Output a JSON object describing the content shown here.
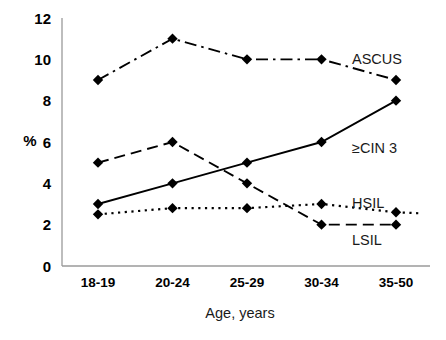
{
  "chart_data": {
    "type": "line",
    "title": "",
    "xlabel": "Age, years",
    "ylabel": "%",
    "categories": [
      "18-19",
      "20-24",
      "25-29",
      "30-34",
      "35-50"
    ],
    "ylim": [
      0,
      12
    ],
    "yticks": [
      0,
      2,
      4,
      6,
      8,
      10,
      12
    ],
    "grid": false,
    "legend_position": "inline-right",
    "series": [
      {
        "name": "ASCUS",
        "values": [
          9,
          11,
          10,
          10,
          9
        ],
        "line_style": "dash-dot",
        "marker": "diamond",
        "color": "#000000",
        "label_x_offset": 8,
        "label_value": 10
      },
      {
        "name": "≥CIN 3",
        "values": [
          3,
          4,
          5,
          6,
          8
        ],
        "line_style": "solid",
        "marker": "diamond",
        "color": "#000000",
        "label_x_offset": 8,
        "label_value": 5.7
      },
      {
        "name": "HSIL",
        "values": [
          2.5,
          2.8,
          2.8,
          3,
          2.6
        ],
        "line_style": "dotted",
        "marker": "diamond",
        "color": "#000000",
        "label_x_offset": 8,
        "label_value": 3.0
      },
      {
        "name": "LSIL",
        "values": [
          5,
          6,
          4,
          2,
          2
        ],
        "line_style": "dashed",
        "marker": "diamond",
        "color": "#000000",
        "label_x_offset": 8,
        "label_value": 1.3
      }
    ]
  },
  "axes": {
    "y_tick_labels": [
      "12",
      "10",
      "8",
      "6",
      "4",
      "2",
      "0"
    ],
    "x_tick_labels": [
      "18-19",
      "20-24",
      "25-29",
      "30-34",
      "35-50"
    ],
    "y_axis_title": "%",
    "x_axis_title": "Age, years"
  },
  "series_labels": {
    "ascus": "ASCUS",
    "cin3": "≥CIN 3",
    "hsil": "HSIL",
    "lsil": "LSIL"
  }
}
